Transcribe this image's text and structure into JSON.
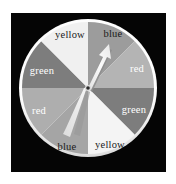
{
  "figure": {
    "background_color": "#ffffff",
    "panel_color": "#050505",
    "width": 176,
    "height": 184
  },
  "spinner": {
    "name": "color-spinner-wheel",
    "center": {
      "x": 88,
      "y": 88
    },
    "radius": 66,
    "rim_color": "#f2f2f2",
    "hub_color": "#2b2b2b",
    "sector_count": 8,
    "pointer": {
      "name": "spinner-pointer",
      "tip": {
        "x": 109,
        "y": 44
      },
      "tail": {
        "x": 66,
        "y": 137
      },
      "points_to": "blue",
      "arrow_color": "#ededed",
      "shadow_color": "#8f8f8f"
    },
    "sectors": [
      {
        "label": "blue",
        "position": "top-right",
        "fill": "#9c9c9c",
        "text_color": "#1a1a1a",
        "start_deg": -90,
        "end_deg": -45,
        "label_x": 113,
        "label_y": 37
      },
      {
        "label": "red",
        "position": "right-upper",
        "fill": "#b4b4b4",
        "text_color": "#ffffff",
        "start_deg": -45,
        "end_deg": 0,
        "label_x": 137,
        "label_y": 72
      },
      {
        "label": "green",
        "position": "right-lower",
        "fill": "#7d7d7d",
        "text_color": "#ffffff",
        "start_deg": 0,
        "end_deg": 45,
        "label_x": 134,
        "label_y": 113
      },
      {
        "label": "yellow",
        "position": "bottom-right",
        "fill": "#f4f4f4",
        "text_color": "#1a1a1a",
        "label_x": 110,
        "label_y": 148,
        "start_deg": 45,
        "end_deg": 90
      },
      {
        "label": "blue",
        "position": "bottom-left",
        "fill": "#a5a5a5",
        "text_color": "#1a1a1a",
        "start_deg": 90,
        "end_deg": 135,
        "label_x": 67,
        "label_y": 150
      },
      {
        "label": "red",
        "position": "left-lower",
        "fill": "#aeaeae",
        "text_color": "#ffffff",
        "start_deg": 135,
        "end_deg": 180,
        "label_x": 39,
        "label_y": 114
      },
      {
        "label": "green",
        "position": "left-upper",
        "fill": "#7d7d7d",
        "text_color": "#ffffff",
        "start_deg": 180,
        "end_deg": 225,
        "label_x": 42,
        "label_y": 74
      },
      {
        "label": "yellow",
        "position": "top-left",
        "fill": "#f0f0f0",
        "text_color": "#1a1a1a",
        "start_deg": 225,
        "end_deg": 270,
        "label_x": 70,
        "label_y": 38
      }
    ]
  }
}
